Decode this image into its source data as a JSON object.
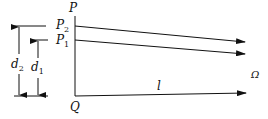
{
  "diagram": {
    "labels": {
      "P": "P",
      "P2": "P",
      "P2_sub": "2",
      "P1": "P",
      "P1_sub": "1",
      "Q": "Q",
      "d2": "d",
      "d2_sub": "2",
      "d1": "d",
      "d1_sub": "1",
      "l": "l",
      "omega": "Ω"
    },
    "colors": {
      "line": "#111111",
      "background": "#ffffff"
    }
  }
}
